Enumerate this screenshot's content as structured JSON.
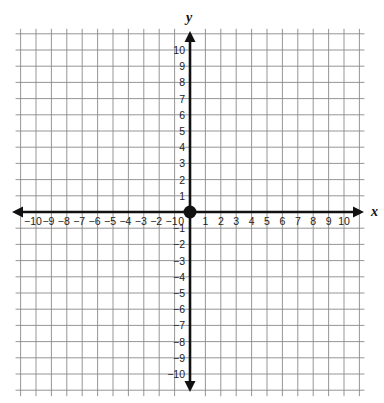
{
  "chart_data": {
    "type": "coordinate-plane",
    "title": "",
    "xlabel": "x",
    "ylabel": "y",
    "xlim": [
      -10,
      10
    ],
    "ylim": [
      -10,
      10
    ],
    "grid": true,
    "grid_range": [
      -11,
      11
    ],
    "x_ticks": [
      -10,
      -9,
      -8,
      -7,
      -6,
      -5,
      -4,
      -3,
      -2,
      -1,
      1,
      2,
      3,
      4,
      5,
      6,
      7,
      8,
      9,
      10
    ],
    "y_ticks": [
      -10,
      -9,
      -8,
      -7,
      -6,
      -5,
      -4,
      -3,
      -2,
      -1,
      1,
      2,
      3,
      4,
      5,
      6,
      7,
      8,
      9,
      10
    ],
    "origin_label": "0",
    "points": [
      {
        "x": 0,
        "y": 0,
        "label": "origin"
      }
    ]
  },
  "colors": {
    "grid": "#8a8a8a",
    "axis": "#111111",
    "background": "#ffffff"
  }
}
